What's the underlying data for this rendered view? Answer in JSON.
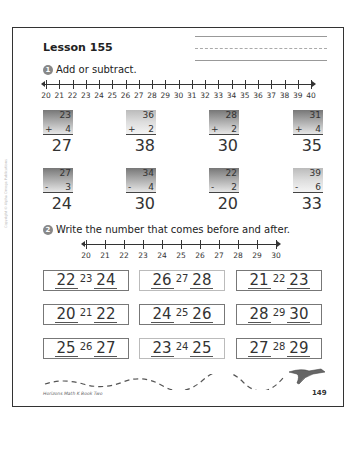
{
  "lesson": {
    "title": "Lesson 155"
  },
  "section1": {
    "badge": "1",
    "instruction": "Add or subtract.",
    "number_line": {
      "start": 20,
      "end": 40,
      "labels": [
        "20",
        "21",
        "22",
        "23",
        "24",
        "25",
        "26",
        "27",
        "28",
        "29",
        "30",
        "31",
        "32",
        "33",
        "34",
        "35",
        "36",
        "37",
        "38",
        "39",
        "40"
      ]
    },
    "problems": [
      {
        "top": "23",
        "op": "+",
        "bottom": "4",
        "answer": "27",
        "shade": "dark"
      },
      {
        "top": "36",
        "op": "+",
        "bottom": "2",
        "answer": "38",
        "shade": "light"
      },
      {
        "top": "28",
        "op": "+",
        "bottom": "2",
        "answer": "30",
        "shade": "dark"
      },
      {
        "top": "31",
        "op": "+",
        "bottom": "4",
        "answer": "35",
        "shade": "dark"
      },
      {
        "top": "27",
        "op": "-",
        "bottom": "3",
        "answer": "24",
        "shade": "dark"
      },
      {
        "top": "34",
        "op": "-",
        "bottom": "4",
        "answer": "30",
        "shade": "dark"
      },
      {
        "top": "22",
        "op": "-",
        "bottom": "2",
        "answer": "20",
        "shade": "dark"
      },
      {
        "top": "39",
        "op": "-",
        "bottom": "6",
        "answer": "33",
        "shade": "light"
      }
    ]
  },
  "section2": {
    "badge": "2",
    "instruction": "Write the number that comes before and after.",
    "number_line": {
      "start": 20,
      "end": 30,
      "labels": [
        "20",
        "21",
        "22",
        "23",
        "24",
        "25",
        "26",
        "27",
        "28",
        "29",
        "30"
      ]
    },
    "sequences": [
      {
        "before": "22",
        "given": "23",
        "after": "24"
      },
      {
        "before": "26",
        "given": "27",
        "after": "28"
      },
      {
        "before": "21",
        "given": "22",
        "after": "23"
      },
      {
        "before": "20",
        "given": "21",
        "after": "22"
      },
      {
        "before": "24",
        "given": "25",
        "after": "26"
      },
      {
        "before": "28",
        "given": "29",
        "after": "30"
      },
      {
        "before": "25",
        "given": "26",
        "after": "27"
      },
      {
        "before": "23",
        "given": "24",
        "after": "25"
      },
      {
        "before": "27",
        "given": "28",
        "after": "29"
      }
    ]
  },
  "footer": {
    "book": "Horizons Math K Book Two",
    "page_number": "149",
    "copyright": "Copyright © Alpha Omega Publications"
  }
}
